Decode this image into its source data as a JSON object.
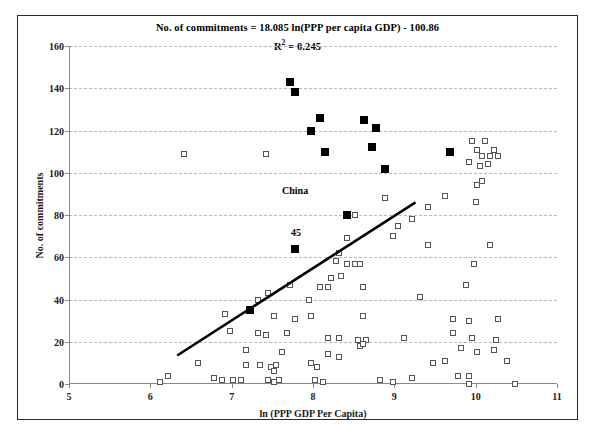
{
  "chart_data": {
    "type": "scatter",
    "title": "",
    "annotations": [
      {
        "text": "No. of commitments = 18.085 ln(PPP per capita GDP) - 100.86",
        "role": "equation"
      },
      {
        "text": "R",
        "sup": "2",
        "rest": " = 0.245",
        "role": "r-squared"
      },
      {
        "text": "China",
        "x": 7.78,
        "y": 92,
        "role": "point-label"
      },
      {
        "text": "45",
        "x": 7.79,
        "y": 72,
        "role": "point-label"
      }
    ],
    "xlabel": "ln (PPP GDP Per Capita)",
    "ylabel": "No. of commitments",
    "xlim": [
      5,
      11
    ],
    "ylim": [
      0,
      160
    ],
    "xticks": [
      5,
      6,
      7,
      8,
      9,
      10,
      11
    ],
    "yticks": [
      0,
      20,
      40,
      60,
      80,
      100,
      120,
      140,
      160
    ],
    "grid": "horizontal-dashed",
    "legend": "none",
    "trendline": {
      "slope": 18.085,
      "intercept": -100.86,
      "x_start": 6.33,
      "x_end": 9.26,
      "y_start": 13.5,
      "y_end": 86
    },
    "series": [
      {
        "name": "Highlighted countries",
        "marker": "filled-square",
        "color": "#000000",
        "points": [
          [
            7.72,
            143
          ],
          [
            7.78,
            138
          ],
          [
            8.08,
            126
          ],
          [
            7.98,
            120
          ],
          [
            8.63,
            125
          ],
          [
            8.78,
            121
          ],
          [
            8.15,
            110
          ],
          [
            8.72,
            112
          ],
          [
            9.68,
            110
          ],
          [
            8.88,
            102
          ],
          [
            8.42,
            80
          ],
          [
            7.78,
            64
          ],
          [
            7.22,
            35
          ]
        ]
      },
      {
        "name": "Other countries",
        "marker": "open-square",
        "color": "#555555",
        "points": [
          [
            6.42,
            109
          ],
          [
            7.42,
            109
          ],
          [
            9.96,
            115
          ],
          [
            10.12,
            115
          ],
          [
            10.02,
            111
          ],
          [
            10.22,
            111
          ],
          [
            10.08,
            108
          ],
          [
            10.18,
            108
          ],
          [
            10.28,
            108
          ],
          [
            9.92,
            105
          ],
          [
            10.05,
            103
          ],
          [
            10.15,
            104
          ],
          [
            9.62,
            89
          ],
          [
            10.08,
            96
          ],
          [
            10.02,
            94
          ],
          [
            8.88,
            88
          ],
          [
            10.0,
            86
          ],
          [
            9.42,
            84
          ],
          [
            9.22,
            78
          ],
          [
            8.52,
            80
          ],
          [
            9.05,
            75
          ],
          [
            8.98,
            70
          ],
          [
            8.42,
            69
          ],
          [
            9.42,
            66
          ],
          [
            8.32,
            62
          ],
          [
            10.18,
            66
          ],
          [
            8.28,
            58
          ],
          [
            8.42,
            57
          ],
          [
            8.52,
            57
          ],
          [
            8.58,
            57
          ],
          [
            9.98,
            57
          ],
          [
            8.22,
            50
          ],
          [
            8.35,
            51
          ],
          [
            7.72,
            47
          ],
          [
            8.08,
            46
          ],
          [
            8.18,
            46
          ],
          [
            8.62,
            46
          ],
          [
            9.88,
            47
          ],
          [
            7.45,
            43
          ],
          [
            9.32,
            41
          ],
          [
            7.32,
            40
          ],
          [
            7.95,
            40
          ],
          [
            6.92,
            33
          ],
          [
            7.52,
            32
          ],
          [
            7.78,
            31
          ],
          [
            7.98,
            32
          ],
          [
            8.62,
            32
          ],
          [
            9.72,
            31
          ],
          [
            9.92,
            30
          ],
          [
            10.28,
            31
          ],
          [
            6.98,
            25
          ],
          [
            7.32,
            24
          ],
          [
            7.42,
            23
          ],
          [
            7.68,
            24
          ],
          [
            8.18,
            22
          ],
          [
            8.32,
            22
          ],
          [
            8.55,
            21
          ],
          [
            8.65,
            21
          ],
          [
            9.12,
            22
          ],
          [
            9.72,
            24
          ],
          [
            9.95,
            22
          ],
          [
            10.25,
            21
          ],
          [
            7.18,
            16
          ],
          [
            7.62,
            15
          ],
          [
            8.18,
            14
          ],
          [
            8.32,
            13
          ],
          [
            8.58,
            18
          ],
          [
            8.62,
            19
          ],
          [
            9.82,
            17
          ],
          [
            10.02,
            15
          ],
          [
            10.22,
            16
          ],
          [
            6.58,
            10
          ],
          [
            7.18,
            9
          ],
          [
            7.35,
            9
          ],
          [
            7.48,
            8
          ],
          [
            7.52,
            6
          ],
          [
            7.55,
            9
          ],
          [
            7.98,
            10
          ],
          [
            8.05,
            8
          ],
          [
            9.48,
            10
          ],
          [
            9.62,
            11
          ],
          [
            9.78,
            4
          ],
          [
            9.92,
            4
          ],
          [
            10.38,
            11
          ],
          [
            6.22,
            4
          ],
          [
            6.78,
            3
          ],
          [
            6.88,
            2
          ],
          [
            7.02,
            2
          ],
          [
            7.12,
            2
          ],
          [
            7.45,
            2
          ],
          [
            7.52,
            1
          ],
          [
            7.58,
            2
          ],
          [
            8.02,
            2
          ],
          [
            8.12,
            1
          ],
          [
            9.22,
            3
          ],
          [
            9.92,
            0
          ],
          [
            10.48,
            0
          ],
          [
            6.12,
            1
          ],
          [
            8.82,
            2
          ],
          [
            8.98,
            1
          ]
        ]
      }
    ]
  },
  "caption": {
    "text": ""
  }
}
